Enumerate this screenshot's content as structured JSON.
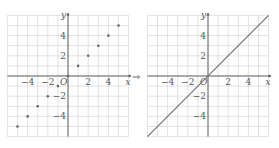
{
  "chart_data": [
    {
      "type": "scatter",
      "title": "",
      "xlabel": "x",
      "ylabel": "y",
      "origin_label": "O",
      "xlim": [
        -6,
        6
      ],
      "ylim": [
        -6,
        6
      ],
      "grid": true,
      "x_ticks": [
        -4,
        -2,
        2,
        4
      ],
      "y_ticks": [
        4,
        2,
        -2,
        -4
      ],
      "x_tick_labels": [
        "−4",
        "−2",
        "2",
        "4"
      ],
      "y_tick_labels": [
        "4",
        "2",
        "−2",
        "−4"
      ],
      "x": [
        -5,
        -4,
        -3,
        -2,
        -1,
        0,
        1,
        2,
        3,
        4,
        5
      ],
      "y": [
        -5,
        -4,
        -3,
        -2,
        -1,
        0,
        1,
        2,
        3,
        4,
        5
      ]
    },
    {
      "type": "line",
      "title": "",
      "xlabel": "x",
      "ylabel": "y",
      "origin_label": "O",
      "xlim": [
        -6,
        6
      ],
      "ylim": [
        -6,
        6
      ],
      "grid": true,
      "x_ticks": [
        -4,
        -2,
        2,
        4
      ],
      "y_ticks": [
        4,
        2,
        -2,
        -4
      ],
      "x_tick_labels": [
        "−4",
        "−2",
        "2",
        "4"
      ],
      "y_tick_labels": [
        "4",
        "2",
        "−2",
        "−4"
      ],
      "x": [
        -6,
        6
      ],
      "y": [
        -6,
        6
      ],
      "equation": "y = x"
    }
  ],
  "transition_arrow": "⇒"
}
